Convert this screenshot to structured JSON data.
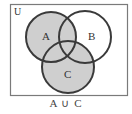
{
  "diagram": {
    "type": "venn",
    "universe_label": "U",
    "sets": [
      {
        "name": "A",
        "label": "A",
        "cx": 51,
        "cy": 37,
        "r": 25,
        "shaded": true
      },
      {
        "name": "B",
        "label": "B",
        "cx": 85,
        "cy": 37,
        "r": 26,
        "shaded": false
      },
      {
        "name": "C",
        "label": "C",
        "cx": 68,
        "cy": 67,
        "r": 26,
        "shaded": true
      }
    ],
    "shaded_region": "A ∪ C",
    "caption": "A ∪ C",
    "colors": {
      "shade": "#cfcfcf",
      "outline": "#3a3a3a",
      "frame": "#7a7a7a",
      "background": "#ffffff"
    }
  }
}
